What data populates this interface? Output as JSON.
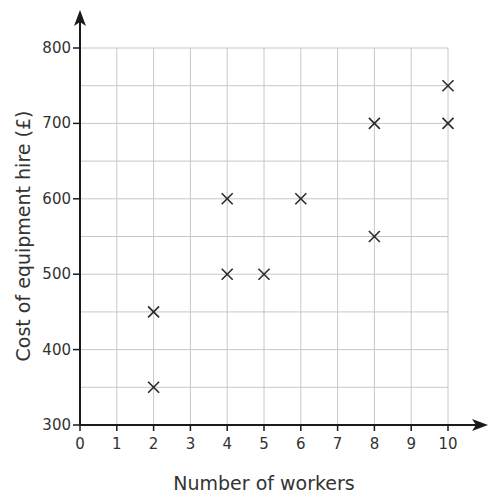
{
  "chart_data": {
    "type": "scatter",
    "title": "",
    "xlabel": "Number of workers",
    "ylabel": "Cost of equipment hire (£)",
    "xlim": [
      0,
      10
    ],
    "ylim": [
      300,
      800
    ],
    "x_ticks": [
      0,
      1,
      2,
      3,
      4,
      5,
      6,
      7,
      8,
      9,
      10
    ],
    "y_ticks": [
      300,
      400,
      500,
      600,
      700,
      800
    ],
    "grid": true,
    "grid_minor_y_step": 50,
    "marker": "x",
    "points": [
      {
        "x": 2,
        "y": 350
      },
      {
        "x": 2,
        "y": 450
      },
      {
        "x": 4,
        "y": 500
      },
      {
        "x": 4,
        "y": 600
      },
      {
        "x": 5,
        "y": 500
      },
      {
        "x": 6,
        "y": 600
      },
      {
        "x": 8,
        "y": 550
      },
      {
        "x": 8,
        "y": 700
      },
      {
        "x": 10,
        "y": 700
      },
      {
        "x": 10,
        "y": 750
      }
    ]
  },
  "colors": {
    "axis": "#1a1a1a",
    "grid": "#c8c8c8",
    "marker": "#2a2a2a",
    "text": "#333333"
  }
}
